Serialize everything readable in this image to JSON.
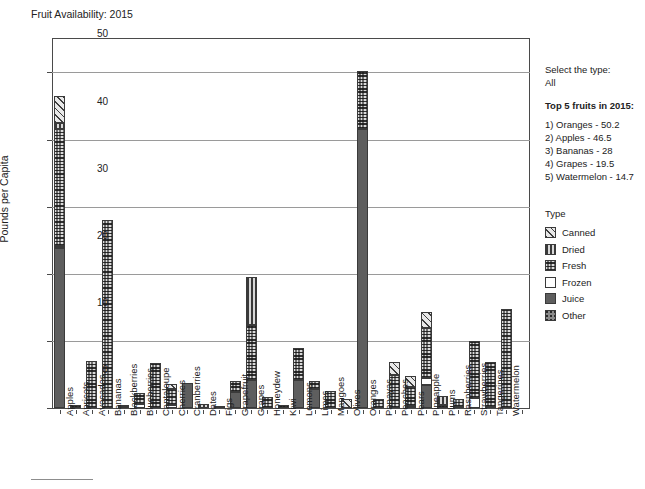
{
  "title": "Fruit Availability: 2015",
  "side_panel": {
    "select_label": "Select the type:",
    "select_value": "All",
    "top5_heading": "Top 5 fruits in 2015:",
    "top5": [
      "1) Oranges - 50.2",
      "2) Apples - 46.5",
      "3) Bananas - 28",
      "4) Grapes - 19.5",
      "5) Watermelon - 14.7"
    ]
  },
  "legend": {
    "title": "Type",
    "entries": [
      {
        "label": "Canned",
        "pattern": "diagonal-hatch",
        "color": "#e8e8e8"
      },
      {
        "label": "Dried",
        "pattern": "vertical-lines",
        "color": "#d8d8d8"
      },
      {
        "label": "Fresh",
        "pattern": "cross-dotted",
        "color": "#6e6e6e"
      },
      {
        "label": "Frozen",
        "pattern": "solid-white",
        "color": "#ffffff"
      },
      {
        "label": "Juice",
        "pattern": "solid-gray",
        "color": "#5e5e5e"
      },
      {
        "label": "Other",
        "pattern": "sparse-dots",
        "color": "#8a8a8a"
      }
    ]
  },
  "chart_data": {
    "type": "bar",
    "stacked": true,
    "title": "Fruit Availability: 2015",
    "xlabel": "",
    "ylabel": "Pounds per Capita",
    "ylim": [
      0,
      52
    ],
    "yticks": [
      0,
      10,
      20,
      30,
      40,
      50
    ],
    "grid": true,
    "legend_position": "right",
    "series": [
      {
        "name": "Canned",
        "values": [
          4.0,
          0,
          0,
          0,
          0,
          0,
          0,
          0.7,
          0,
          0,
          0,
          0,
          0,
          0,
          0,
          0,
          0,
          0,
          1.4,
          0,
          0,
          1.9,
          1.6,
          2.4,
          0,
          0,
          0,
          0,
          0,
          0
        ]
      },
      {
        "name": "Dried",
        "values": [
          0.9,
          0,
          0,
          0,
          0,
          0,
          0,
          0,
          0,
          0.6,
          0.3,
          0,
          7.2,
          0,
          0,
          0,
          0,
          0,
          0,
          0,
          0,
          0,
          0,
          0,
          1.3,
          0,
          0,
          0,
          0,
          0
        ]
      },
      {
        "name": "Fresh",
        "values": [
          17.4,
          0.5,
          7.0,
          28.0,
          0.3,
          1.6,
          6.7,
          2.4,
          0,
          0,
          0,
          1.6,
          8.2,
          1.7,
          0.5,
          4.8,
          1.2,
          2.5,
          0,
          8.7,
          1.4,
          4.9,
          2.8,
          7.4,
          0.5,
          1.1,
          8.5,
          6.6,
          14.7,
          0
        ]
      },
      {
        "name": "Frozen",
        "values": [
          0.4,
          0,
          0,
          0,
          0.1,
          0.6,
          0,
          0.5,
          0,
          0,
          0,
          0,
          0,
          0,
          0,
          0,
          0,
          0,
          0,
          0,
          0,
          0,
          0,
          1.1,
          0,
          0.2,
          1.5,
          0,
          0,
          0
        ]
      },
      {
        "name": "Juice",
        "values": [
          23.8,
          0,
          0,
          0,
          0,
          0,
          0,
          0,
          3.7,
          0,
          0,
          2.4,
          4.1,
          0,
          0,
          4.2,
          2.8,
          0,
          0,
          41.5,
          0,
          0,
          0.3,
          3.4,
          0,
          0,
          0,
          0.2,
          0,
          0
        ]
      },
      {
        "name": "Other",
        "values": [
          0,
          0,
          0,
          0,
          0,
          0,
          0,
          0,
          0,
          0,
          0,
          0,
          0,
          0,
          0,
          0,
          0,
          0,
          0,
          0,
          0,
          0,
          0,
          0,
          0,
          0,
          0,
          0,
          0,
          0
        ]
      }
    ],
    "categories": [
      "Apples",
      "Apricots",
      "Avocados",
      "Bananas",
      "Blackberries",
      "Blueberries",
      "Cantaloupe",
      "Cherries",
      "Cranberries",
      "Dates",
      "Figs",
      "Grapefruit",
      "Grapes",
      "Honeydew",
      "Kiwi",
      "Lemons",
      "Limes",
      "Mangoes",
      "Olives",
      "Oranges",
      "Papayas",
      "Peaches",
      "Pears",
      "Pineapple",
      "Plums",
      "Raspberries",
      "Strawberries",
      "Tangerines",
      "Watermelon",
      "Other"
    ],
    "totals": [
      46.5,
      0.5,
      7.0,
      28.0,
      0.4,
      2.2,
      6.7,
      3.6,
      3.7,
      0.6,
      0.3,
      4.0,
      19.5,
      1.7,
      0.5,
      9.0,
      4.0,
      2.5,
      1.4,
      50.2,
      1.4,
      6.8,
      4.7,
      14.3,
      1.8,
      1.3,
      10.0,
      6.8,
      14.7,
      0
    ]
  }
}
